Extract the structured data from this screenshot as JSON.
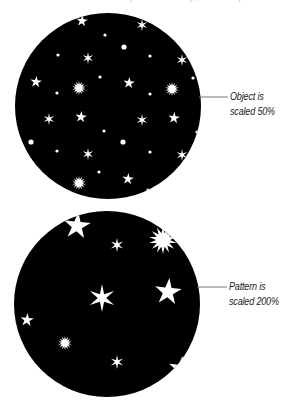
{
  "figure": {
    "header_cropped_text": "... pattern fill only, or the object alone",
    "colors": {
      "background": "#ffffff",
      "circle_fill": "#000000",
      "star_fill": "#ffffff",
      "leader_line": "#777777",
      "caption_text": "#222222"
    },
    "panels": [
      {
        "id": "object-scaled",
        "circle": {
          "cx": 108,
          "cy": 106,
          "r": 93
        },
        "leader": {
          "x1": 199,
          "y1": 97,
          "x2": 228,
          "y2": 97
        },
        "caption": {
          "x": 230,
          "y": 89,
          "line1": "Object is",
          "line2": "scaled 50%"
        },
        "stars": [
          {
            "type": "star5",
            "x": 82,
            "y": 21,
            "r": 6
          },
          {
            "type": "star6",
            "x": 142,
            "y": 25,
            "r": 6
          },
          {
            "type": "dot",
            "x": 105,
            "y": 35,
            "r": 1.6
          },
          {
            "type": "glow",
            "x": 124,
            "y": 47,
            "r": 2.6
          },
          {
            "type": "dot",
            "x": 58,
            "y": 55,
            "r": 1.6
          },
          {
            "type": "star6",
            "x": 88,
            "y": 58,
            "r": 6
          },
          {
            "type": "dot",
            "x": 150,
            "y": 56,
            "r": 1.6
          },
          {
            "type": "star6",
            "x": 182,
            "y": 60,
            "r": 6
          },
          {
            "type": "dot",
            "x": 100,
            "y": 77,
            "r": 1.6
          },
          {
            "type": "dot",
            "x": 193,
            "y": 78,
            "r": 1.6
          },
          {
            "type": "star5",
            "x": 36,
            "y": 82,
            "r": 6
          },
          {
            "type": "star5",
            "x": 129,
            "y": 83,
            "r": 6
          },
          {
            "type": "burst",
            "x": 79,
            "y": 88,
            "r": 7
          },
          {
            "type": "dot",
            "x": 57,
            "y": 93,
            "r": 1.6
          },
          {
            "type": "dot",
            "x": 150,
            "y": 94,
            "r": 1.6
          },
          {
            "type": "burst",
            "x": 172,
            "y": 89,
            "r": 7
          },
          {
            "type": "star6",
            "x": 49,
            "y": 119,
            "r": 6
          },
          {
            "type": "star5",
            "x": 81,
            "y": 117,
            "r": 6
          },
          {
            "type": "star6",
            "x": 142,
            "y": 120,
            "r": 6
          },
          {
            "type": "star5",
            "x": 174,
            "y": 118,
            "r": 6
          },
          {
            "type": "dot",
            "x": 104,
            "y": 131,
            "r": 1.6
          },
          {
            "type": "dot",
            "x": 197,
            "y": 132,
            "r": 1.6
          },
          {
            "type": "glow",
            "x": 31,
            "y": 142,
            "r": 2.6
          },
          {
            "type": "dot",
            "x": 57,
            "y": 151,
            "r": 1.6
          },
          {
            "type": "star6",
            "x": 88,
            "y": 154,
            "r": 6
          },
          {
            "type": "glow",
            "x": 123,
            "y": 142,
            "r": 2.6
          },
          {
            "type": "dot",
            "x": 150,
            "y": 152,
            "r": 1.6
          },
          {
            "type": "star6",
            "x": 182,
            "y": 155,
            "r": 6
          },
          {
            "type": "dot",
            "x": 99,
            "y": 172,
            "r": 1.6
          },
          {
            "type": "star5",
            "x": 128,
            "y": 179,
            "r": 6
          },
          {
            "type": "burst",
            "x": 79,
            "y": 183,
            "r": 7
          },
          {
            "type": "dot",
            "x": 148,
            "y": 190,
            "r": 1.6
          }
        ]
      },
      {
        "id": "pattern-scaled",
        "circle": {
          "cx": 107,
          "cy": 304,
          "r": 93
        },
        "leader": {
          "x1": 197,
          "y1": 287,
          "x2": 227,
          "y2": 287
        },
        "caption": {
          "x": 229,
          "y": 279,
          "line1": "Pattern is",
          "line2": "scaled 200%"
        },
        "stars": [
          {
            "type": "star5",
            "x": 77,
            "y": 226,
            "r": 14
          },
          {
            "type": "star6",
            "x": 117,
            "y": 245,
            "r": 7
          },
          {
            "type": "burst",
            "x": 163,
            "y": 240,
            "r": 14
          },
          {
            "type": "star6",
            "x": 102,
            "y": 298,
            "r": 14
          },
          {
            "type": "star5",
            "x": 168,
            "y": 292,
            "r": 14
          },
          {
            "type": "star5",
            "x": 27,
            "y": 320,
            "r": 7
          },
          {
            "type": "burst",
            "x": 65,
            "y": 343,
            "r": 7
          },
          {
            "type": "star6",
            "x": 117,
            "y": 362,
            "r": 7
          },
          {
            "type": "star5",
            "x": 181,
            "y": 369,
            "r": 13
          }
        ]
      }
    ]
  }
}
